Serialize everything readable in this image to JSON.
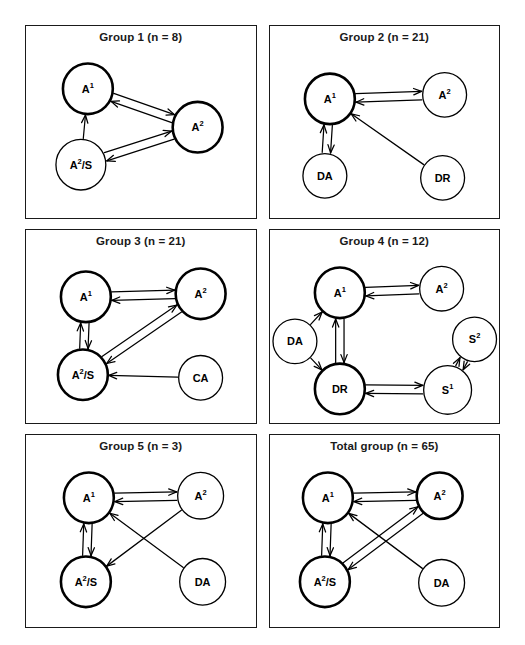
{
  "figure": {
    "type": "network-diagram-grid",
    "panel_count": 6,
    "columns": 2,
    "rows": 3,
    "background_color": "#ffffff",
    "line_color": "#000000"
  },
  "panels": [
    {
      "id": "group-1",
      "title": "Group 1 (n = 8)",
      "group_label": "Group 1",
      "n": 8,
      "nodes": [
        {
          "id": "A1",
          "label": "A",
          "sup": "1",
          "x": 62,
          "y": 62,
          "r": 25,
          "emphasis": "bold"
        },
        {
          "id": "A2",
          "label": "A",
          "sup": "2",
          "x": 172,
          "y": 100,
          "r": 25,
          "emphasis": "bold"
        },
        {
          "id": "A2S",
          "label": "A",
          "sup": "2",
          "suffix": "/S",
          "x": 55,
          "y": 137,
          "r": 25,
          "emphasis": "thin"
        }
      ],
      "edges": [
        {
          "from": "A1",
          "to": "A2",
          "direction": "both"
        },
        {
          "from": "A2S",
          "to": "A1",
          "direction": "forward"
        },
        {
          "from": "A2S",
          "to": "A2",
          "direction": "both"
        }
      ]
    },
    {
      "id": "group-2",
      "title": "Group 2 (n = 21)",
      "group_label": "Group 2",
      "n": 21,
      "nodes": [
        {
          "id": "A1",
          "label": "A",
          "sup": "1",
          "x": 60,
          "y": 72,
          "r": 25,
          "emphasis": "bold"
        },
        {
          "id": "A2",
          "label": "A",
          "sup": "2",
          "x": 175,
          "y": 68,
          "r": 22,
          "emphasis": "thin"
        },
        {
          "id": "DA",
          "label": "DA",
          "x": 55,
          "y": 148,
          "r": 22,
          "emphasis": "thin"
        },
        {
          "id": "DR",
          "label": "DR",
          "x": 173,
          "y": 150,
          "r": 22,
          "emphasis": "thin"
        }
      ],
      "edges": [
        {
          "from": "A1",
          "to": "A2",
          "direction": "both"
        },
        {
          "from": "A1",
          "to": "DA",
          "direction": "both"
        },
        {
          "from": "DR",
          "to": "A1",
          "direction": "forward"
        }
      ]
    },
    {
      "id": "group-3",
      "title": "Group 3 (n = 21)",
      "group_label": "Group 3",
      "n": 21,
      "nodes": [
        {
          "id": "A1",
          "label": "A",
          "sup": "1",
          "x": 60,
          "y": 66,
          "r": 25,
          "emphasis": "bold"
        },
        {
          "id": "A2",
          "label": "A",
          "sup": "2",
          "x": 175,
          "y": 63,
          "r": 25,
          "emphasis": "bold"
        },
        {
          "id": "A2S",
          "label": "A",
          "sup": "2",
          "suffix": "/S",
          "x": 57,
          "y": 143,
          "r": 25,
          "emphasis": "bold"
        },
        {
          "id": "CA",
          "label": "CA",
          "x": 175,
          "y": 146,
          "r": 22,
          "emphasis": "thin"
        }
      ],
      "edges": [
        {
          "from": "A1",
          "to": "A2",
          "direction": "both"
        },
        {
          "from": "A1",
          "to": "A2S",
          "direction": "both"
        },
        {
          "from": "A2S",
          "to": "A2",
          "direction": "both"
        },
        {
          "from": "CA",
          "to": "A2S",
          "direction": "forward"
        }
      ]
    },
    {
      "id": "group-4",
      "title": "Group 4 (n = 12)",
      "group_label": "Group 4",
      "n": 12,
      "nodes": [
        {
          "id": "A1",
          "label": "A",
          "sup": "1",
          "x": 70,
          "y": 62,
          "r": 25,
          "emphasis": "bold"
        },
        {
          "id": "A2",
          "label": "A",
          "sup": "2",
          "x": 172,
          "y": 58,
          "r": 22,
          "emphasis": "thin"
        },
        {
          "id": "DA",
          "label": "DA",
          "x": 25,
          "y": 110,
          "r": 22,
          "emphasis": "thin"
        },
        {
          "id": "DR",
          "label": "DR",
          "x": 70,
          "y": 157,
          "r": 25,
          "emphasis": "bold"
        },
        {
          "id": "S1",
          "label": "S",
          "sup": "1",
          "x": 178,
          "y": 158,
          "r": 24,
          "emphasis": "thin"
        },
        {
          "id": "S2",
          "label": "S",
          "sup": "2",
          "x": 205,
          "y": 108,
          "r": 22,
          "emphasis": "thin"
        }
      ],
      "edges": [
        {
          "from": "A1",
          "to": "A2",
          "direction": "both"
        },
        {
          "from": "A1",
          "to": "DR",
          "direction": "both"
        },
        {
          "from": "DA",
          "to": "A1",
          "direction": "forward"
        },
        {
          "from": "DA",
          "to": "DR",
          "direction": "forward"
        },
        {
          "from": "DR",
          "to": "S1",
          "direction": "both"
        },
        {
          "from": "S1",
          "to": "S2",
          "direction": "both"
        }
      ]
    },
    {
      "id": "group-5",
      "title": "Group 5 (n = 3)",
      "group_label": "Group 5",
      "n": 3,
      "nodes": [
        {
          "id": "A1",
          "label": "A",
          "sup": "1",
          "x": 63,
          "y": 62,
          "r": 25,
          "emphasis": "bold"
        },
        {
          "id": "A2",
          "label": "A",
          "sup": "2",
          "x": 175,
          "y": 60,
          "r": 23,
          "emphasis": "thin"
        },
        {
          "id": "A2S",
          "label": "A",
          "sup": "2",
          "suffix": "/S",
          "x": 60,
          "y": 145,
          "r": 25,
          "emphasis": "bold"
        },
        {
          "id": "DA",
          "label": "DA",
          "x": 177,
          "y": 145,
          "r": 23,
          "emphasis": "thin"
        }
      ],
      "edges": [
        {
          "from": "A1",
          "to": "A2",
          "direction": "both"
        },
        {
          "from": "A1",
          "to": "A2S",
          "direction": "both"
        },
        {
          "from": "A2",
          "to": "A2S",
          "direction": "forward"
        },
        {
          "from": "DA",
          "to": "A1",
          "direction": "forward"
        }
      ]
    },
    {
      "id": "total-group",
      "title": "Total group (n = 65)",
      "group_label": "Total group",
      "n": 65,
      "nodes": [
        {
          "id": "A1",
          "label": "A",
          "sup": "1",
          "x": 58,
          "y": 62,
          "r": 25,
          "emphasis": "bold"
        },
        {
          "id": "A2",
          "label": "A",
          "sup": "2",
          "x": 170,
          "y": 60,
          "r": 23,
          "emphasis": "bold"
        },
        {
          "id": "A2S",
          "label": "A",
          "sup": "2",
          "suffix": "/S",
          "x": 55,
          "y": 145,
          "r": 25,
          "emphasis": "bold"
        },
        {
          "id": "DA",
          "label": "DA",
          "x": 172,
          "y": 146,
          "r": 23,
          "emphasis": "thin"
        }
      ],
      "edges": [
        {
          "from": "A1",
          "to": "A2",
          "direction": "both"
        },
        {
          "from": "A1",
          "to": "A2S",
          "direction": "both"
        },
        {
          "from": "A2S",
          "to": "A2",
          "direction": "both"
        },
        {
          "from": "DA",
          "to": "A1",
          "direction": "forward"
        }
      ]
    }
  ]
}
